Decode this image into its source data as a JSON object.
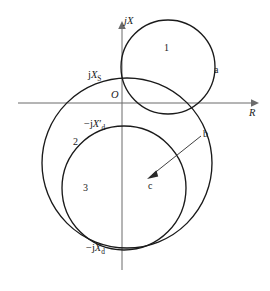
{
  "figure": {
    "kind": "impedance-locus-diagram",
    "background_color": "#ffffff",
    "curve_color": "#1a1a1a",
    "axis_color": "#6b6b6b",
    "width": 270,
    "height": 291
  },
  "axes": {
    "vertical": {
      "label": "jX",
      "name": "reactance-axis",
      "x": 122,
      "y_top": 22,
      "y_bottom": 270
    },
    "horizontal": {
      "label": "R",
      "name": "resistance-axis",
      "y": 103,
      "x_left": 18,
      "x_right": 258
    },
    "origin": {
      "label": "O",
      "x": 122,
      "y": 103
    }
  },
  "tick_labels": [
    {
      "id": "jXs",
      "prefix": "j",
      "symbol": "X",
      "prime": "",
      "subscript": "S",
      "text": "jX_S",
      "x": 122,
      "y": 78
    },
    {
      "id": "minus-jXd-prime",
      "prefix": "−j",
      "symbol": "X",
      "prime": "′",
      "subscript": "d",
      "text": "−jX′_d",
      "x": 122,
      "y": 127
    },
    {
      "id": "minus-jXd",
      "prefix": "−j",
      "symbol": "X",
      "prime": "",
      "subscript": "d",
      "text": "−jX_d",
      "x": 122,
      "y": 249
    }
  ],
  "circles": [
    {
      "id": "circle-1",
      "label": "1",
      "cx": 168,
      "cy": 67,
      "r": 47,
      "label_x": 164,
      "label_y": 48
    },
    {
      "id": "circle-2",
      "label": "2",
      "cx": 127,
      "cy": 163,
      "r": 85,
      "label_x": 76,
      "label_y": 142
    },
    {
      "id": "circle-3",
      "label": "3",
      "cx": 124,
      "cy": 188,
      "r": 62,
      "label_x": 85,
      "label_y": 188
    }
  ],
  "points": [
    {
      "id": "point-a",
      "label": "a",
      "x": 216,
      "y": 70
    },
    {
      "id": "point-b",
      "label": "b",
      "x": 205,
      "y": 134
    },
    {
      "id": "point-c",
      "label": "c",
      "x": 152,
      "y": 186
    }
  ],
  "radius_arrow": {
    "name": "radius-vector-bc",
    "from_x": 201,
    "from_y": 136,
    "to_x": 148,
    "to_y": 178
  },
  "caption": {
    "text": ""
  }
}
